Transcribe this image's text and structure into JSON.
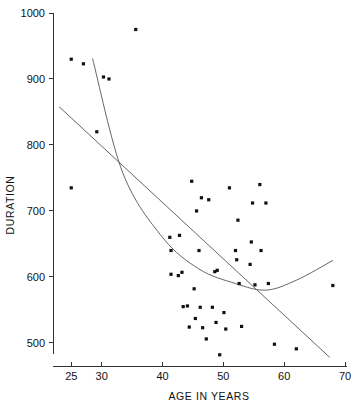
{
  "chart_data": {
    "type": "scatter",
    "title": "",
    "xlabel": "AGE IN YEARS",
    "ylabel": "DURATION",
    "xlim": [
      22,
      70
    ],
    "ylim": [
      465,
      1000
    ],
    "grid": false,
    "legend": "none",
    "xticks": [
      25,
      30,
      40,
      50,
      60,
      70
    ],
    "xtick_labels": [
      "25",
      "30",
      "40",
      "50",
      "60",
      "70"
    ],
    "yticks": [
      500,
      600,
      700,
      800,
      900,
      1000
    ],
    "ytick_labels": [
      "500",
      "600",
      "700",
      "800",
      "900",
      "1000"
    ],
    "marker": "filled-square",
    "point_color": "#111111",
    "line_color": "#555555",
    "points": [
      {
        "x": 25.0,
        "y": 930
      },
      {
        "x": 25.0,
        "y": 735
      },
      {
        "x": 27.0,
        "y": 923
      },
      {
        "x": 29.2,
        "y": 820
      },
      {
        "x": 30.3,
        "y": 903
      },
      {
        "x": 31.2,
        "y": 900
      },
      {
        "x": 35.6,
        "y": 975
      },
      {
        "x": 41.2,
        "y": 660
      },
      {
        "x": 41.4,
        "y": 640
      },
      {
        "x": 41.4,
        "y": 604
      },
      {
        "x": 42.6,
        "y": 602
      },
      {
        "x": 42.8,
        "y": 663
      },
      {
        "x": 43.2,
        "y": 607
      },
      {
        "x": 43.4,
        "y": 555
      },
      {
        "x": 44.1,
        "y": 556
      },
      {
        "x": 44.4,
        "y": 524
      },
      {
        "x": 44.8,
        "y": 745
      },
      {
        "x": 45.2,
        "y": 582
      },
      {
        "x": 45.4,
        "y": 537
      },
      {
        "x": 45.6,
        "y": 700
      },
      {
        "x": 46.0,
        "y": 640
      },
      {
        "x": 46.2,
        "y": 554
      },
      {
        "x": 46.4,
        "y": 720
      },
      {
        "x": 46.6,
        "y": 523
      },
      {
        "x": 47.2,
        "y": 506
      },
      {
        "x": 47.6,
        "y": 717
      },
      {
        "x": 48.2,
        "y": 554
      },
      {
        "x": 48.6,
        "y": 608
      },
      {
        "x": 48.8,
        "y": 531
      },
      {
        "x": 49.0,
        "y": 610
      },
      {
        "x": 49.4,
        "y": 482
      },
      {
        "x": 50.1,
        "y": 546
      },
      {
        "x": 50.4,
        "y": 521
      },
      {
        "x": 51.0,
        "y": 735
      },
      {
        "x": 52.0,
        "y": 640
      },
      {
        "x": 52.2,
        "y": 626
      },
      {
        "x": 52.4,
        "y": 686
      },
      {
        "x": 52.6,
        "y": 590
      },
      {
        "x": 53.0,
        "y": 525
      },
      {
        "x": 54.4,
        "y": 619
      },
      {
        "x": 54.6,
        "y": 653
      },
      {
        "x": 54.8,
        "y": 712
      },
      {
        "x": 55.2,
        "y": 588
      },
      {
        "x": 56.0,
        "y": 740
      },
      {
        "x": 56.2,
        "y": 640
      },
      {
        "x": 57.0,
        "y": 712
      },
      {
        "x": 57.4,
        "y": 590
      },
      {
        "x": 58.4,
        "y": 498
      },
      {
        "x": 62.0,
        "y": 491
      },
      {
        "x": 68.0,
        "y": 587
      }
    ],
    "fits": [
      {
        "name": "linear-regression",
        "type": "line",
        "endpoints": [
          [
            23.0,
            858
          ],
          [
            67.5,
            478
          ]
        ]
      },
      {
        "name": "quadratic-fit",
        "type": "curve",
        "control_points": [
          [
            28.5,
            931
          ],
          [
            33.5,
            757
          ],
          [
            40.0,
            660
          ],
          [
            46.0,
            612
          ],
          [
            52.0,
            590
          ],
          [
            57.0,
            580
          ],
          [
            62.0,
            595
          ],
          [
            68.0,
            625
          ]
        ]
      }
    ]
  }
}
